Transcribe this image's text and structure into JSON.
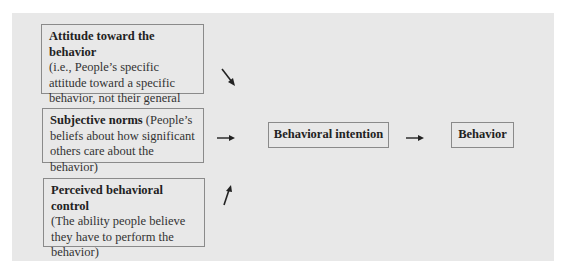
{
  "diagram": {
    "determinants": [
      {
        "title": "Attitude toward the behavior",
        "description": "(i.e., People’s specific attitude toward a specific behavior, not their general attitude)"
      },
      {
        "title": "Subjective norms",
        "description": "(People’s beliefs about how significant others care about the behavior)"
      },
      {
        "title": "Perceived behavioral control",
        "description": "(The ability people believe they have to perform the behavior)"
      }
    ],
    "intention": {
      "label": "Behavioral intention"
    },
    "outcome": {
      "label": "Behavior"
    },
    "arrows": [
      {
        "from": "Attitude toward the behavior",
        "to": "Behavioral intention",
        "direction": "down-right"
      },
      {
        "from": "Subjective norms",
        "to": "Behavioral intention",
        "direction": "right"
      },
      {
        "from": "Perceived behavioral control",
        "to": "Behavioral intention",
        "direction": "up-right"
      },
      {
        "from": "Behavioral intention",
        "to": "Behavior",
        "direction": "right"
      }
    ],
    "colors": {
      "panel_background": "#e8e8e8",
      "box_border": "#8a8a8a",
      "text": "#222222"
    }
  }
}
